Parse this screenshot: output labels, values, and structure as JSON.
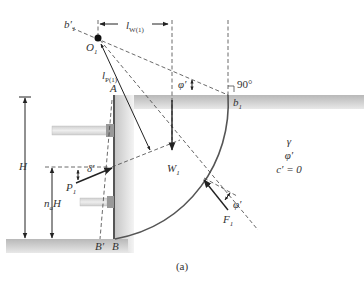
{
  "figure": {
    "caption": "(a)",
    "labels": {
      "b1_prime": "b′",
      "b1_prime_sub": "1",
      "O1": "O",
      "O1_sub": "1",
      "lW1": "l",
      "lW1_sub": "W(1)",
      "lP1": "l",
      "lP1_sub": "P(1)",
      "A": "A",
      "phi_top": "φ′",
      "angle_90": "90°",
      "b1": "b",
      "b1_sub": "1",
      "H": "H",
      "naH": "n",
      "naH_sub": "a",
      "naH_tail": "H",
      "delta": "δ′",
      "P1": "P",
      "P1_sub": "1",
      "W1": "W",
      "W1_sub": "1",
      "F1": "F",
      "F1_sub": "1",
      "phi_F": "φ′",
      "B_prime": "B′",
      "B": "B",
      "soil_gamma": "γ",
      "soil_phi": "φ′",
      "soil_c": "c′ = 0"
    }
  }
}
